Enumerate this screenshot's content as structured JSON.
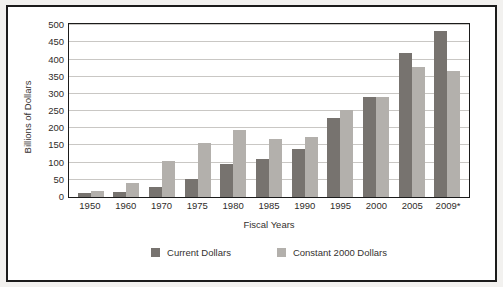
{
  "chart_data": {
    "type": "bar",
    "title": "",
    "xlabel": "Fiscal Years",
    "ylabel": "Billions of Dollars",
    "ylim": [
      0,
      500
    ],
    "yticks": [
      0,
      50,
      100,
      150,
      200,
      250,
      300,
      350,
      400,
      450,
      500
    ],
    "grid": true,
    "legend_position": "bottom",
    "categories": [
      "1950",
      "1960",
      "1970",
      "1975",
      "1980",
      "1985",
      "1990",
      "1995",
      "2000",
      "2005",
      "2009*"
    ],
    "series": [
      {
        "name": "Current Dollars",
        "color": "#77736f",
        "values": [
          12,
          14,
          30,
          52,
          95,
          112,
          140,
          230,
          290,
          418,
          482
        ]
      },
      {
        "name": "Constant 2000 Dollars",
        "color": "#b3b0ac",
        "values": [
          17,
          42,
          105,
          157,
          195,
          168,
          175,
          253,
          290,
          378,
          368
        ]
      }
    ]
  },
  "colors": {
    "series_current": "#77736f",
    "series_constant": "#b3b0ac",
    "axis": "#1b1b1b",
    "gridline": "#c9c7c4",
    "page_background": "#f2f1ef",
    "plot_background": "#ffffff"
  }
}
